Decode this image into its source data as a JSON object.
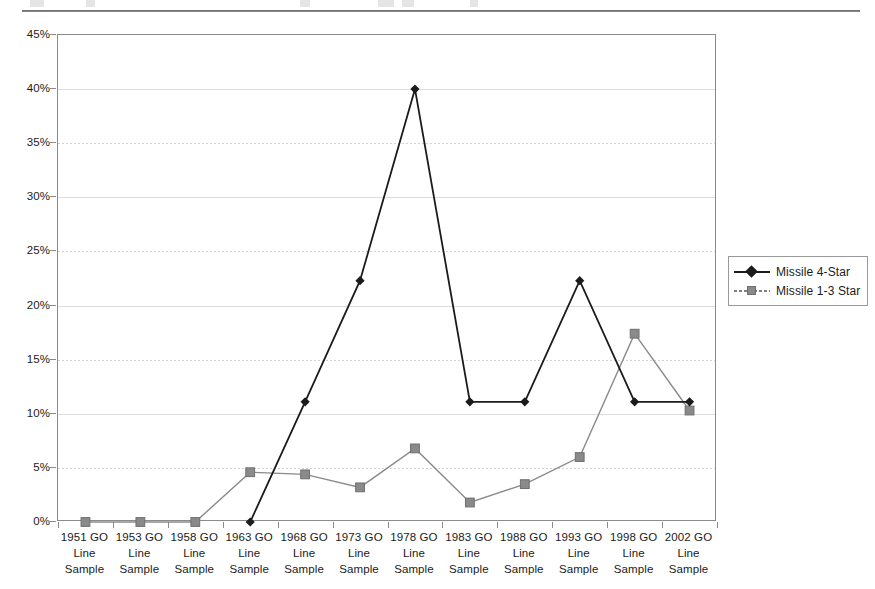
{
  "page": {
    "top_rule": true,
    "background": "#ffffff"
  },
  "chart_data": {
    "type": "line",
    "title": "",
    "subtitle": "",
    "xlabel": "",
    "ylabel": "",
    "ylim": [
      0,
      45
    ],
    "ytick_step": 5,
    "ytick_labels": [
      "0%",
      "5%",
      "10%",
      "15%",
      "20%",
      "25%",
      "30%",
      "35%",
      "40%",
      "45%"
    ],
    "ytick_values": [
      0,
      5,
      10,
      15,
      20,
      25,
      30,
      35,
      40,
      45
    ],
    "grid": true,
    "legend_position": "right",
    "categories": [
      "1951 GO Line Sample",
      "1953 GO Line Sample",
      "1958 GO Line Sample",
      "1963 GO Line Sample",
      "1968 GO Line Sample",
      "1973 GO Line Sample",
      "1978 GO Line Sample",
      "1983 GO Line Sample",
      "1988 GO Line Sample",
      "1993 GO Line Sample",
      "1998 GO Line Sample",
      "2002 GO Line Sample"
    ],
    "category_lines": [
      [
        "1951 GO",
        "Line",
        "Sample"
      ],
      [
        "1953 GO",
        "Line",
        "Sample"
      ],
      [
        "1958 GO",
        "Line",
        "Sample"
      ],
      [
        "1963 GO",
        "Line",
        "Sample"
      ],
      [
        "1968 GO",
        "Line",
        "Sample"
      ],
      [
        "1973 GO",
        "Line",
        "Sample"
      ],
      [
        "1978 GO",
        "Line",
        "Sample"
      ],
      [
        "1983 GO",
        "Line",
        "Sample"
      ],
      [
        "1988 GO",
        "Line",
        "Sample"
      ],
      [
        "1993 GO",
        "Line",
        "Sample"
      ],
      [
        "1998 GO",
        "Line",
        "Sample"
      ],
      [
        "2002 GO",
        "Line",
        "Sample"
      ]
    ],
    "series": [
      {
        "name": "Missile 4-Star",
        "color": "#1b1b1b",
        "marker": "diamond",
        "values": [
          null,
          null,
          null,
          0.0,
          11.1,
          22.3,
          40.0,
          11.1,
          11.1,
          22.3,
          11.1,
          11.1
        ]
      },
      {
        "name": "Missile 1-3 Star",
        "color": "#8a8a8a",
        "marker": "square",
        "values": [
          0.0,
          0.0,
          0.0,
          4.6,
          4.4,
          3.2,
          6.8,
          1.8,
          3.5,
          6.0,
          17.4,
          10.3
        ]
      }
    ]
  },
  "legend": {
    "items": [
      {
        "label": "Missile 4-Star",
        "marker": "diamond-marker",
        "color": "#1b1b1b"
      },
      {
        "label": "Missile 1-3 Star",
        "marker": "square-marker",
        "color": "#8a8a8a"
      }
    ]
  }
}
